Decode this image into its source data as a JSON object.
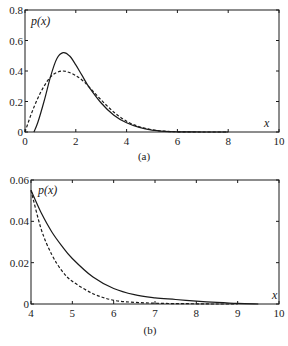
{
  "chart_data": [
    {
      "type": "line",
      "caption": "(a)",
      "ylabel": "p(x)",
      "xlabel": "x",
      "xlim": [
        0,
        10
      ],
      "ylim": [
        0,
        0.8
      ],
      "xticks": [
        "0",
        "2",
        "4",
        "6",
        "8",
        "10"
      ],
      "yticks": [
        "0",
        "0.2",
        "0.4",
        "0.6",
        "0.8"
      ],
      "grid": false,
      "legend": null,
      "series": [
        {
          "name": "solid",
          "style": "solid",
          "x": [
            0.35,
            0.5,
            0.75,
            1.0,
            1.25,
            1.5,
            1.75,
            2.0,
            2.25,
            2.5,
            3.0,
            3.5,
            4.0,
            4.5,
            5.0,
            5.5,
            6.0,
            7.0,
            8.0
          ],
          "y": [
            0.0,
            0.06,
            0.2,
            0.36,
            0.48,
            0.52,
            0.5,
            0.44,
            0.37,
            0.3,
            0.19,
            0.11,
            0.06,
            0.03,
            0.012,
            0.004,
            0.001,
            0.0,
            0.0
          ]
        },
        {
          "name": "dashed",
          "style": "dashed",
          "x": [
            0.0,
            0.25,
            0.5,
            0.75,
            1.0,
            1.25,
            1.5,
            1.75,
            2.0,
            2.25,
            2.5,
            3.0,
            3.5,
            4.0,
            4.5,
            5.0,
            5.5,
            6.0,
            7.0,
            8.0
          ],
          "y": [
            0.0,
            0.12,
            0.22,
            0.3,
            0.36,
            0.39,
            0.4,
            0.39,
            0.37,
            0.34,
            0.3,
            0.21,
            0.13,
            0.07,
            0.035,
            0.015,
            0.005,
            0.001,
            0.0,
            0.0
          ]
        }
      ]
    },
    {
      "type": "line",
      "caption": "(b)",
      "ylabel": "p(x)",
      "xlabel": "x",
      "xlim": [
        4,
        10
      ],
      "ylim": [
        0,
        0.06
      ],
      "xticks": [
        "4",
        "5",
        "6",
        "7",
        "8",
        "9",
        "10"
      ],
      "yticks": [
        "0",
        "0.02",
        "0.04",
        "0.06"
      ],
      "grid": false,
      "legend": null,
      "series": [
        {
          "name": "solid",
          "style": "solid",
          "x": [
            4.0,
            4.25,
            4.5,
            4.75,
            5.0,
            5.5,
            6.0,
            6.5,
            7.0,
            7.5,
            8.0,
            8.5,
            9.0,
            9.5
          ],
          "y": [
            0.055,
            0.044,
            0.035,
            0.028,
            0.022,
            0.013,
            0.0075,
            0.0045,
            0.003,
            0.0022,
            0.0014,
            0.0008,
            0.0003,
            0.0
          ]
        },
        {
          "name": "dashed",
          "style": "dashed",
          "x": [
            4.0,
            4.25,
            4.5,
            4.75,
            5.0,
            5.5,
            6.0,
            6.5,
            7.0,
            7.5,
            8.0,
            8.5,
            9.0
          ],
          "y": [
            0.055,
            0.036,
            0.024,
            0.016,
            0.011,
            0.005,
            0.0018,
            0.0008,
            0.0004,
            0.0002,
            0.0001,
            0.0,
            0.0
          ]
        }
      ]
    }
  ]
}
